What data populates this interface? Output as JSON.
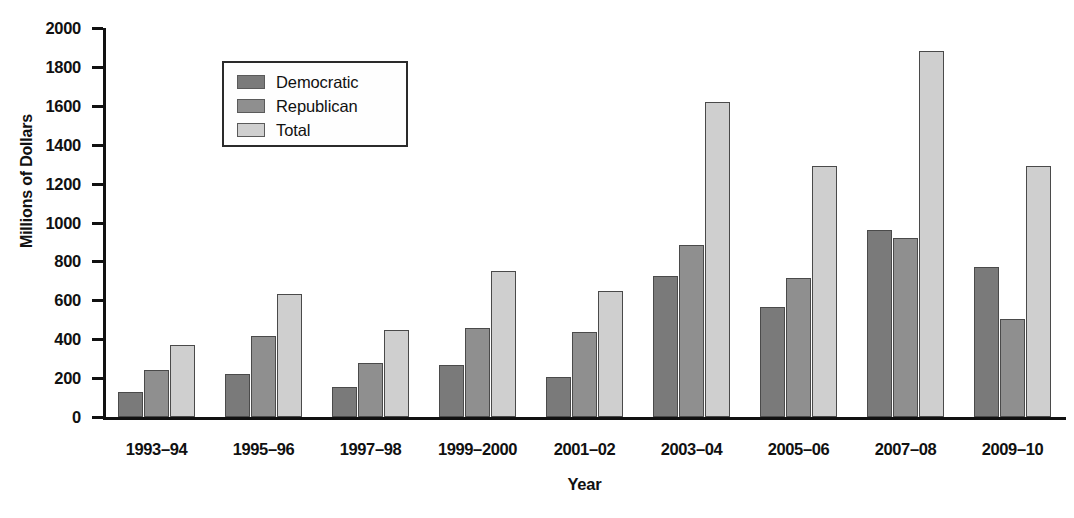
{
  "chart_data": {
    "type": "bar",
    "title": "",
    "xlabel": "Year",
    "ylabel": "Millions of Dollars",
    "ylim": [
      0,
      2000
    ],
    "ytick_step": 200,
    "yticks": [
      0,
      200,
      400,
      600,
      800,
      1000,
      1200,
      1400,
      1600,
      1800,
      2000
    ],
    "grid": false,
    "legend_position": "top-left",
    "categories": [
      "1993–94",
      "1995–96",
      "1997–98",
      "1999–2000",
      "2001–02",
      "2003–04",
      "2005–06",
      "2007–08",
      "2009–10"
    ],
    "series": [
      {
        "name": "Democratic",
        "color": "#7a7a7a",
        "values": [
          130,
          220,
          155,
          270,
          205,
          725,
          565,
          960,
          770
        ]
      },
      {
        "name": "Republican",
        "color": "#8f8f8f",
        "values": [
          240,
          415,
          280,
          460,
          435,
          885,
          715,
          920,
          505
        ]
      },
      {
        "name": "Total",
        "color": "#cfcfcf",
        "values": [
          370,
          635,
          445,
          750,
          650,
          1620,
          1290,
          1880,
          1290
        ]
      }
    ]
  },
  "axes": {
    "y_title": "Millions of Dollars",
    "x_title": "Year"
  },
  "colors": {
    "axis": "#111111",
    "legend_border": "#2b2b2b",
    "bar_outline": "#4a4a4a",
    "background": "#ffffff"
  }
}
